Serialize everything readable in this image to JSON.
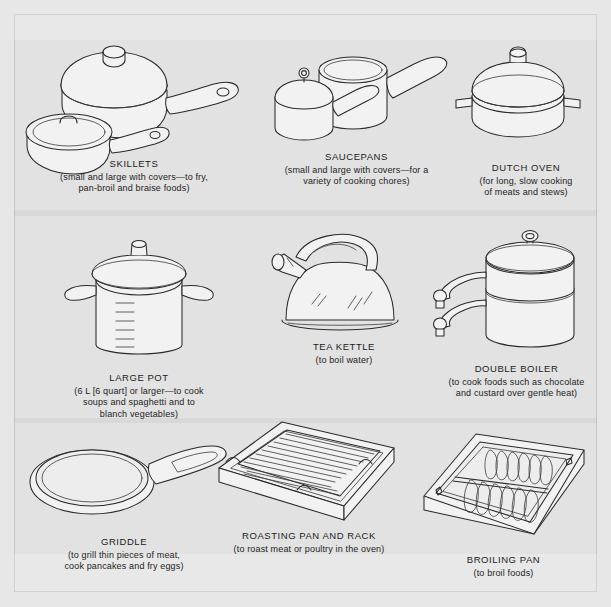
{
  "page": {
    "background_color": "#e2e2e2",
    "line_color": "#2a2a2a"
  },
  "items": [
    {
      "id": "skillets",
      "icon": "skillets-icon",
      "title": "SKILLETS",
      "description_lines": [
        "(small and large with covers—to fry,",
        "pan-broil and braise foods)"
      ]
    },
    {
      "id": "saucepans",
      "icon": "saucepans-icon",
      "title": "SAUCEPANS",
      "description_lines": [
        "(small and large with covers—for a",
        "variety of cooking chores)"
      ]
    },
    {
      "id": "dutch-oven",
      "icon": "dutch-oven-icon",
      "title": "DUTCH OVEN",
      "description_lines": [
        "(for long, slow cooking",
        "of meats and stews)"
      ]
    },
    {
      "id": "large-pot",
      "icon": "large-pot-icon",
      "title": "LARGE POT",
      "description_lines": [
        "(6 L [6 quart] or larger—to cook",
        "soups and spaghetti and to",
        "blanch vegetables)"
      ]
    },
    {
      "id": "tea-kettle",
      "icon": "tea-kettle-icon",
      "title": "TEA KETTLE",
      "description_lines": [
        "(to boil water)"
      ]
    },
    {
      "id": "double-boiler",
      "icon": "double-boiler-icon",
      "title": "DOUBLE BOILER",
      "description_lines": [
        "(to cook foods such as chocolate",
        "and custard over gentle heat)"
      ]
    },
    {
      "id": "griddle",
      "icon": "griddle-icon",
      "title": "GRIDDLE",
      "description_lines": [
        "(to grill thin pieces of meat,",
        "cook pancakes and fry eggs)"
      ]
    },
    {
      "id": "roasting-pan",
      "icon": "roasting-pan-and-rack-icon",
      "title": "ROASTING PAN AND RACK",
      "description_lines": [
        "(to roast meat or poultry in the oven)"
      ]
    },
    {
      "id": "broiling-pan",
      "icon": "broiling-pan-icon",
      "title": "BROILING PAN",
      "description_lines": [
        "(to broil foods)"
      ]
    }
  ]
}
